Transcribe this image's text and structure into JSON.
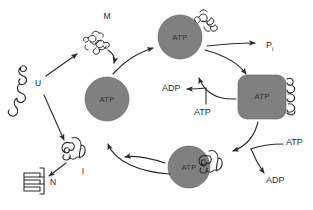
{
  "figure": {
    "background_color": "#ffffff",
    "ink_color": "#2b2b2b",
    "chaperone_fill": "#808080"
  },
  "states": {
    "unfolded": {
      "label": "U",
      "description": "unfolded polypeptide chain"
    },
    "misfolded": {
      "label": "M",
      "description": "misfolded aggregated chain"
    },
    "intermediate": {
      "label": "I",
      "description": "partially folded intermediate"
    },
    "native": {
      "label": "N",
      "description": "native folded protein"
    }
  },
  "chaperones": [
    {
      "id": "chaperone-top",
      "label": "ATP",
      "shape": "circle",
      "bound_substrate": "misfolded"
    },
    {
      "id": "chaperone-center",
      "label": "ATP",
      "shape": "circle",
      "bound_substrate": "none"
    },
    {
      "id": "chaperone-right",
      "label": "ATP",
      "shape": "rounded-square",
      "bound_substrate": "extended"
    },
    {
      "id": "chaperone-bottom",
      "label": "ATP",
      "shape": "circle",
      "bound_substrate": "intermediate"
    }
  ],
  "nucleotides": {
    "phosphate": {
      "label": "P",
      "subscript": "i"
    },
    "adp_upper": {
      "label": "ADP"
    },
    "atp_upper": {
      "label": "ATP"
    },
    "atp_lower": {
      "label": "ATP"
    },
    "adp_lower": {
      "label": "ADP"
    }
  }
}
